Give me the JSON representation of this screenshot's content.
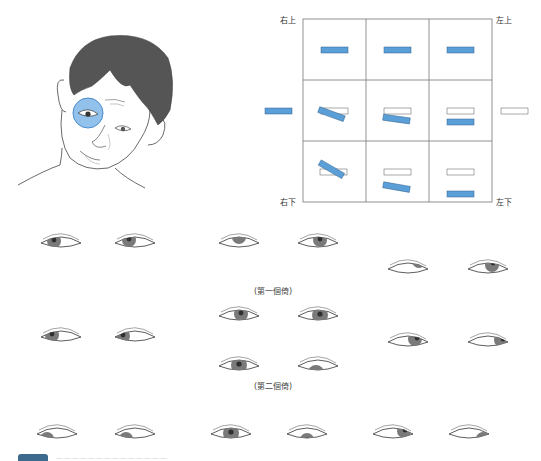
{
  "figure": {
    "grid": {
      "corner_labels": {
        "top_left": "右上",
        "top_right": "左上",
        "bottom_left": "右下",
        "bottom_right": "左下"
      },
      "rows": 3,
      "cols": 3
    },
    "colors": {
      "highlight_blue": "#5b9fd8",
      "iris_gray": "#7a7a7a",
      "pupil_dark": "#2f2f2f",
      "hair": "#555555",
      "grid_line": "#777777"
    },
    "tilt_captions": {
      "first": "(第一個倚)",
      "second": "(第二個倚)"
    },
    "footer": {
      "caption_blurred": "……………………………………"
    }
  }
}
